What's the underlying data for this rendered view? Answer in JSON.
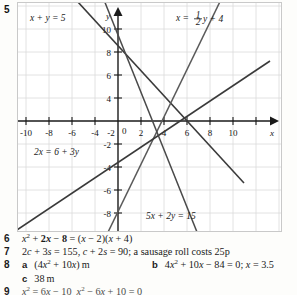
{
  "question_number": "5",
  "figure": {
    "name": "simultaneous-equations-graph",
    "axis": {
      "x_label": "x",
      "y_label": "y",
      "origin_label": "0",
      "x_ticks": [
        "-10",
        "-8",
        "-6",
        "-4",
        "-2",
        "2",
        "4",
        "6",
        "8",
        "10"
      ],
      "y_ticks_positive": [
        "2",
        "4",
        "6",
        "8",
        "10"
      ],
      "y_ticks_negative": [
        "-2",
        "-4",
        "-6",
        "-8",
        "-10"
      ],
      "x_min": -11.5,
      "x_max": 11.5,
      "y_min": -11.5,
      "y_max": 11.5
    },
    "line_labels": {
      "line1": "x + y = 5",
      "line2_prefix": "x =",
      "line2_frac_num": "1",
      "line2_frac_den": "2",
      "line2_suffix": "y + 4",
      "line3": "2x = 6 + 3y",
      "line4": "5x + 2y = 15"
    }
  },
  "chart_data": {
    "type": "line",
    "title": "",
    "xlabel": "x",
    "ylabel": "y",
    "xlim": [
      -11.5,
      11.5
    ],
    "ylim": [
      -11.5,
      11.5
    ],
    "grid": true,
    "grid_step": 2,
    "legend": "inline-labels",
    "series": [
      {
        "name": "x + y = 5",
        "equation": "x + y = 5",
        "slope": -1,
        "intercept": 5,
        "points": [
          [
            -7,
            12
          ],
          [
            11,
            -6
          ]
        ]
      },
      {
        "name": "x = 1/2 y + 4",
        "equation": "x = 0.5y + 4",
        "slope": 2,
        "intercept": -8,
        "points": [
          [
            -1.75,
            -11.5
          ],
          [
            9.75,
            11.5
          ]
        ]
      },
      {
        "name": "2x = 6 + 3y",
        "equation": "2x = 6 + 3y",
        "slope": 0.6667,
        "intercept": -2,
        "points": [
          [
            -11.5,
            -9.67
          ],
          [
            11.5,
            5.67
          ]
        ]
      },
      {
        "name": "5x + 2y = 15",
        "equation": "5x + 2y = 15",
        "slope": -2.5,
        "intercept": 7.5,
        "points": [
          [
            -1.6,
            11.5
          ],
          [
            7.6,
            -11.5
          ]
        ]
      }
    ]
  },
  "answers": [
    {
      "number": "6",
      "body": "x² + 2x − 8 = (x − 2)(x + 4)",
      "body_html": "<span class=\"mathi\">x</span><sup>2</sup> + <b>2<span class=\"mathi\">x</span></b> − <b>8</b> = (<span class=\"mathi\">x</span> − 2)(<span class=\"mathi\">x</span> + 4)"
    },
    {
      "number": "7",
      "body": "2c + 3s = 155, c + 2s = 90; a sausage roll costs 25p",
      "body_html": "2<span class=\"mathi\">c</span> + 3<span class=\"mathi\">s</span> = 155, <span class=\"mathi\">c</span> + 2<span class=\"mathi\">s</span> = 90; a sausage roll costs 25p"
    },
    {
      "number": "8",
      "part_a_label": "a",
      "part_a": "(4x² + 10x) m",
      "part_a_html": "(4<span class=\"mathi\">x</span><sup>2</sup> + 10<span class=\"mathi\">x</span>) m",
      "part_b_label": "b",
      "part_b": "4x² + 10x − 84 = 0; x = 3.5",
      "part_b_html": "4<span class=\"mathi\">x</span><sup>2</sup> + 10<span class=\"mathi\">x</span> − 84 = 0; <span class=\"mathi\">x</span> = 3.5",
      "part_c_label": "c",
      "part_c": "38 m",
      "part_c_html": "38 m"
    },
    {
      "number": "9",
      "body": "x² = 6x − 10, x² − 6x + 10 = 0",
      "body_html": "<span class=\"mathi\">x</span><sup>2</sup> = 6<span class=\"mathi\">x</span> − 10&nbsp; <span class=\"mathi\">x</span><sup>2</sup> − 6<span class=\"mathi\">x</span> + 10 = 0"
    }
  ],
  "colors": {
    "grid": "#d8d8d8",
    "axis": "#1a1a1a",
    "line": "#333333",
    "page_bg": "#fdfdfb",
    "figure_bg": "#ffffff"
  }
}
